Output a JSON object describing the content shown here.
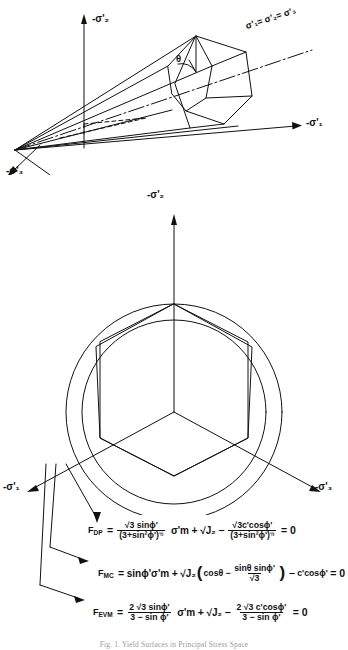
{
  "figure": {
    "caption": "Fig. 1. Yield Surfaces in Principal Stress Space",
    "top_diagram": {
      "name": "principal-stress-space-cone",
      "axis_sigma2": "-σ'₂",
      "axis_sigma1": "-σ'₁",
      "axis_sigma3": "-σ'₃",
      "hydrostatic_axis_label": "σ'₁= σ'₂= σ'₃",
      "lode_angle": "θ"
    },
    "pi_plane": {
      "name": "pi-plane-section",
      "axis_sigma2": "-σ'₂",
      "axis_sigma1": "-σ'₁",
      "axis_sigma3": "-σ'₃",
      "curves": [
        {
          "id": "outer-circle",
          "label": "F_DP"
        },
        {
          "id": "inner-circle",
          "label": "F_EVM"
        },
        {
          "id": "irregular-hexagon",
          "label": "F_MC"
        }
      ]
    },
    "equations": [
      {
        "id": "equation-fdp",
        "name": "F",
        "sub": "DP",
        "eq": "=",
        "coef_num": "√3 sinϕ'",
        "coef_den": "(3+sin²ϕ')",
        "coef_den_exp": "½",
        "var1": "σ'm",
        "plus": "+",
        "var2": "√J₂",
        "minus": "−",
        "term_num": "√3c'cosϕ'",
        "term_den": "(3+sin²ϕ')",
        "term_den_exp": "½",
        "tail": "= 0"
      },
      {
        "id": "equation-fmc",
        "name": "F",
        "sub": "MC",
        "eq": "=",
        "coef": "sinϕ'σ'm",
        "plus": "+",
        "var2": "√J₂",
        "paren_open": "(",
        "inner_first": "cosθ −",
        "inner_num": "sinθ sinϕ'",
        "inner_den": "√3",
        "paren_close": ")",
        "minus": "−",
        "term": "c'cosϕ'",
        "tail": "= 0"
      },
      {
        "id": "equation-fevm",
        "name": "F",
        "sub": "EVM",
        "eq": "=",
        "coef_num": "2 √3 sinϕ'",
        "coef_den": "3 − sin ϕ'",
        "var1": "σ'm",
        "plus": "+",
        "var2": "√J₂",
        "minus": "−",
        "term_num": "2 √3 c'cosϕ'",
        "term_den": "3 − sin ϕ'",
        "tail": "= 0"
      }
    ]
  },
  "colors": {
    "ink": "#111111",
    "paper": "#ffffff",
    "caption": "#9a9a9a"
  }
}
